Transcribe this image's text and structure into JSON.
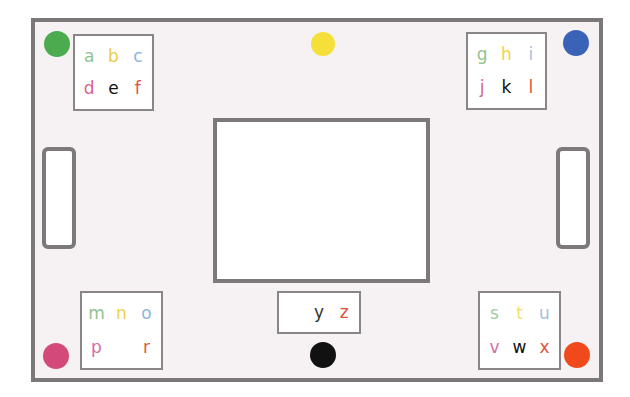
{
  "diagram": {
    "title": "",
    "colors": {
      "board_bg": "#f6f2f3",
      "border": "#7b7879",
      "dot_green": "#4caa4f",
      "dot_yellow": "#f5e03a",
      "dot_blue": "#3a63b8",
      "dot_pink": "#d2497a",
      "dot_black": "#111111",
      "dot_orange": "#f04a1c"
    },
    "boxes": {
      "top_left": {
        "letters": [
          {
            "char": "a",
            "color": "#8fc38f"
          },
          {
            "char": "b",
            "color": "#f2c84a"
          },
          {
            "char": "c",
            "color": "#8fb3dc"
          },
          {
            "char": "d",
            "color": "#d9628a"
          },
          {
            "char": "e",
            "color": "#111111"
          },
          {
            "char": "f",
            "color": "#e0523c"
          }
        ]
      },
      "top_right": {
        "letters": [
          {
            "char": "g",
            "color": "#8fc38f"
          },
          {
            "char": "h",
            "color": "#f2d24a"
          },
          {
            "char": "i",
            "color": "#a9bfe0"
          },
          {
            "char": "j",
            "color": "#d9628a"
          },
          {
            "char": "k",
            "color": "#111111"
          },
          {
            "char": "l",
            "color": "#e0523c"
          }
        ]
      },
      "bottom_left": {
        "letters": [
          {
            "char": "m",
            "color": "#8fc38f"
          },
          {
            "char": "n",
            "color": "#f2d24a"
          },
          {
            "char": "o",
            "color": "#8fb3dc"
          },
          {
            "char": "p",
            "color": "#cf6fa8"
          },
          {
            "char": "",
            "color": "#111111"
          },
          {
            "char": "r",
            "color": "#e0523c"
          }
        ]
      },
      "bottom_right": {
        "letters": [
          {
            "char": "s",
            "color": "#9ccf9c"
          },
          {
            "char": "t",
            "color": "#f2df6a"
          },
          {
            "char": "u",
            "color": "#a9bfe0"
          },
          {
            "char": "v",
            "color": "#cf6fa8"
          },
          {
            "char": "w",
            "color": "#111111"
          },
          {
            "char": "x",
            "color": "#e0523c"
          }
        ]
      },
      "bottom_center": {
        "letters": [
          {
            "char": "",
            "color": "#111111"
          },
          {
            "char": "y",
            "color": "#333333"
          },
          {
            "char": "z",
            "color": "#e0523c"
          }
        ]
      }
    }
  }
}
